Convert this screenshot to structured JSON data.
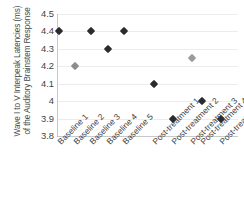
{
  "chart_data": {
    "type": "scatter",
    "title": "",
    "xlabel": "",
    "ylabel": "Wave I to V Interpeak Latencies (ms) of the Auditory Brainstem Response",
    "ylabel_line1": "Wave I to V Interpeak Latencies (ms)",
    "ylabel_line2": "of the Auditory Brainstem Response",
    "ylim": [
      3.8,
      4.5
    ],
    "ytick_labels": [
      "4.5",
      "4.4",
      "4.3",
      "4.2",
      "4.1",
      "4",
      "3.9",
      "3.8"
    ],
    "ytick_values": [
      4.5,
      4.4,
      4.3,
      4.2,
      4.1,
      4.0,
      3.9,
      3.8
    ],
    "grid": true,
    "legend": "none",
    "categories": [
      "Baseline 1",
      "Baseline 2",
      "Baseline 3",
      "Baseline 4",
      "Baseline 5",
      "Post-treatment 1",
      "Post-treatment 2",
      "Post-treatment 3",
      "Post-treatment 4",
      "Post-treatment 5"
    ],
    "values": [
      4.4,
      4.2,
      4.4,
      4.3,
      4.4,
      4.1,
      3.9,
      4.25,
      4.0,
      3.9
    ],
    "point_colors": [
      "#2b2b2b",
      "#8c8c8c",
      "#2b2b2b",
      "#2b2b2b",
      "#2b2b2b",
      "#2b2b2b",
      "#2b2b2b",
      "#9a9a9a",
      "#2b2b2b",
      "#2b2b2b"
    ],
    "x_positions_frac": [
      0.005,
      0.095,
      0.185,
      0.275,
      0.365,
      0.535,
      0.64,
      0.745,
      0.8,
      0.905
    ],
    "marker_shape": "diamond",
    "colors": {
      "dark_marker": "#2b2b2b",
      "gray_marker": "#8c8c8c",
      "gridline": "#ededed",
      "axis": "#c9c9c9",
      "text": "#3f3f3f",
      "background": "#ffffff"
    }
  }
}
